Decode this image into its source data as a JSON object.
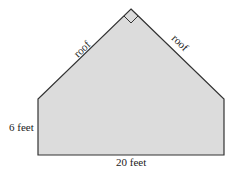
{
  "diagram": {
    "shape": "house-shaped pentagon",
    "fill_color": "#dcdcdc",
    "stroke_color": "#333333",
    "labels": {
      "roof_left": "roof",
      "roof_right": "roof",
      "wall_height": "6 feet",
      "base_width": "20 feet"
    },
    "right_angle_marker_at": "apex"
  }
}
